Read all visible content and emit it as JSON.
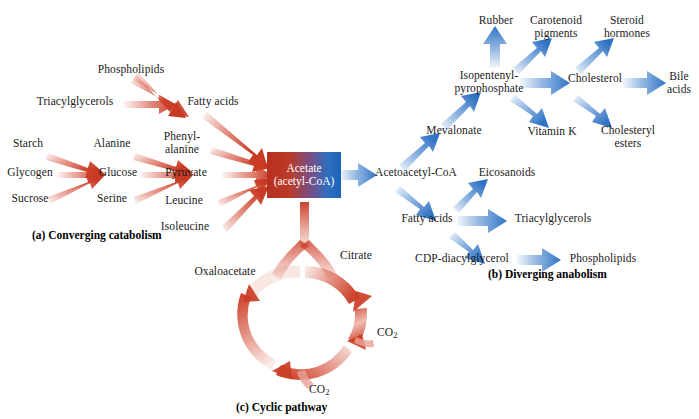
{
  "figure": {
    "center_node": {
      "line1": "Acetate",
      "line2": "(acetyl-CoA)",
      "color_left": "#b8301f",
      "color_right": "#1b63bb"
    },
    "captions": {
      "a": "(a) Converging catabolism",
      "b": "(b) Diverging anabolism",
      "c": "(c) Cyclic pathway"
    },
    "colors": {
      "catabolic_arrow": "#d1432c",
      "anabolic_arrow": "#4a87cf",
      "cycle_arrow": "#d1432c",
      "text": "#1a1a1a",
      "background": "#ffffff"
    }
  },
  "catabolism": {
    "nodes": [
      {
        "id": "phospholipids",
        "label": "Phospholipids"
      },
      {
        "id": "triacylglycerols",
        "label": "Triacylglycerols"
      },
      {
        "id": "fatty-acids",
        "label": "Fatty acids"
      },
      {
        "id": "starch",
        "label": "Starch"
      },
      {
        "id": "glycogen",
        "label": "Glycogen"
      },
      {
        "id": "sucrose",
        "label": "Sucrose"
      },
      {
        "id": "alanine",
        "label": "Alanine"
      },
      {
        "id": "glucose",
        "label": "Glucose"
      },
      {
        "id": "serine",
        "label": "Serine"
      },
      {
        "id": "phenylalanine",
        "label": "Phenyl-\nalanine"
      },
      {
        "id": "pyruvate",
        "label": "Pyruvate"
      },
      {
        "id": "leucine",
        "label": "Leucine"
      },
      {
        "id": "isoleucine",
        "label": "Isoleucine"
      }
    ]
  },
  "anabolism": {
    "nodes": [
      {
        "id": "acetoacetyl-coa",
        "label": "Acetoacetyl-CoA"
      },
      {
        "id": "mevalonate",
        "label": "Mevalonate"
      },
      {
        "id": "isopentenyl-pyrophosphate",
        "label": "Isopentenyl-\npyrophosphate"
      },
      {
        "id": "rubber",
        "label": "Rubber"
      },
      {
        "id": "carotenoid-pigments",
        "label": "Carotenoid\npigments"
      },
      {
        "id": "vitamin-k",
        "label": "Vitamin K"
      },
      {
        "id": "cholesterol",
        "label": "Cholesterol"
      },
      {
        "id": "steroid-hormones",
        "label": "Steroid\nhormones"
      },
      {
        "id": "bile-acids",
        "label": "Bile\nacids"
      },
      {
        "id": "cholesteryl-esters",
        "label": "Cholesteryl\nesters"
      },
      {
        "id": "fatty-acids-anabolic",
        "label": "Fatty acids"
      },
      {
        "id": "eicosanoids",
        "label": "Eicosanoids"
      },
      {
        "id": "triacylglycerols-anabolic",
        "label": "Triacylglycerols"
      },
      {
        "id": "cdp-diacylglycerol",
        "label": "CDP-diacylglycerol"
      },
      {
        "id": "phospholipids-anabolic",
        "label": "Phospholipids"
      }
    ]
  },
  "cycle": {
    "nodes": [
      {
        "id": "citrate",
        "label": "Citrate"
      },
      {
        "id": "oxaloacetate",
        "label": "Oxaloacetate"
      }
    ],
    "byproducts": [
      {
        "id": "co2-upper",
        "label": "CO",
        "subscript": "2"
      },
      {
        "id": "co2-lower",
        "label": "CO",
        "subscript": "2"
      }
    ]
  }
}
